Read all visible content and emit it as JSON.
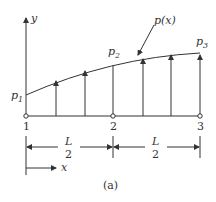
{
  "figure": {
    "caption": "(a)",
    "axes": {
      "y_label": "y",
      "x_label": "x"
    },
    "load_function_label": "p(x)",
    "load_values": [
      {
        "name": "p",
        "sub": "1"
      },
      {
        "name": "p",
        "sub": "2"
      },
      {
        "name": "p",
        "sub": "3"
      }
    ],
    "nodes": [
      "1",
      "2",
      "3"
    ],
    "dimensions": [
      {
        "num": "L",
        "den": "2"
      },
      {
        "num": "L",
        "den": "2"
      }
    ],
    "colors": {
      "line": "#333333",
      "background": "#ffffff"
    }
  }
}
